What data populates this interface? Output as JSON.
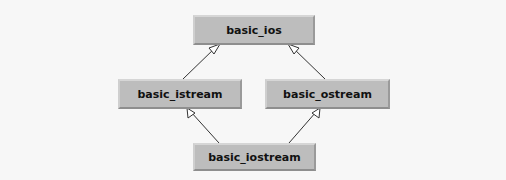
{
  "diagram": {
    "nodes": [
      {
        "id": "basic_ios",
        "label": "basic_ios"
      },
      {
        "id": "basic_istream",
        "label": "basic_istream"
      },
      {
        "id": "basic_ostream",
        "label": "basic_ostream"
      },
      {
        "id": "basic_iostream",
        "label": "basic_iostream"
      }
    ],
    "edges": [
      {
        "from": "basic_istream",
        "to": "basic_ios",
        "type": "inheritance"
      },
      {
        "from": "basic_ostream",
        "to": "basic_ios",
        "type": "inheritance"
      },
      {
        "from": "basic_iostream",
        "to": "basic_istream",
        "type": "inheritance"
      },
      {
        "from": "basic_iostream",
        "to": "basic_ostream",
        "type": "inheritance"
      }
    ]
  }
}
